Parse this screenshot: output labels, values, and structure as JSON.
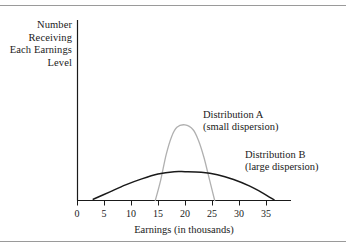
{
  "figure": {
    "y_axis_caption_lines": [
      "Number",
      "Receiving",
      "Each Earnings",
      "Level"
    ],
    "x_axis_title": "Earnings (in thousands)",
    "annotations": {
      "a_title": "Distribution A",
      "a_subtitle": "(small dispersion)",
      "b_title": "Distribution B",
      "b_subtitle": "(large dispersion)"
    }
  },
  "chart_data": {
    "type": "line",
    "title": "",
    "xlabel": "Earnings (in thousands)",
    "ylabel": "Number Receiving Each Earnings Level",
    "xlim": [
      0,
      37
    ],
    "ylim": [
      0,
      1
    ],
    "grid": false,
    "legend_position": "inline-annotation",
    "xticks": [
      0,
      5,
      10,
      15,
      20,
      25,
      30,
      35
    ],
    "xtick_labels": [
      "0",
      "5",
      "10",
      "15",
      "20",
      "25",
      "30",
      "35"
    ],
    "yticks": [],
    "ytick_labels": [],
    "series": [
      {
        "name": "Distribution A",
        "description": "small dispersion",
        "color": "#b0b0b0",
        "mean": 20,
        "peak_x": 20,
        "peak_y": 0.63,
        "x_start": 14.5,
        "x_end": 25.5,
        "x": [
          14.5,
          15.5,
          16.5,
          17.5,
          18.5,
          20.0,
          21.5,
          22.5,
          23.5,
          24.5,
          25.5
        ],
        "y": [
          0.0,
          0.17,
          0.38,
          0.53,
          0.61,
          0.63,
          0.59,
          0.5,
          0.36,
          0.18,
          0.0
        ]
      },
      {
        "name": "Distribution B",
        "description": "large dispersion",
        "color": "#1a1a1a",
        "mean": 20,
        "peak_x": 20,
        "peak_y": 0.24,
        "x_start": 3.0,
        "x_end": 36.5,
        "x": [
          3.0,
          6.0,
          9.0,
          12.0,
          15.0,
          18.0,
          20.0,
          23.0,
          26.0,
          29.0,
          32.0,
          34.5,
          36.5
        ],
        "y": [
          0.01,
          0.07,
          0.13,
          0.18,
          0.22,
          0.24,
          0.24,
          0.235,
          0.215,
          0.175,
          0.12,
          0.06,
          0.005
        ]
      }
    ]
  },
  "colors": {
    "distribution_a": "#b0b0b0",
    "distribution_b": "#1a1a1a",
    "axis": "#1a1a1a",
    "frame_rule": "#9a9a9a"
  },
  "ticks": [
    {
      "label": "0",
      "x": 77
    },
    {
      "label": "5",
      "x": 104
    },
    {
      "label": "10",
      "x": 131
    },
    {
      "label": "15",
      "x": 158
    },
    {
      "label": "20",
      "x": 185
    },
    {
      "label": "25",
      "x": 212
    },
    {
      "label": "30",
      "x": 239
    },
    {
      "label": "35",
      "x": 266
    }
  ]
}
